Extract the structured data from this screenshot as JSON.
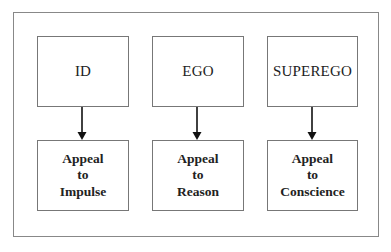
{
  "diagram": {
    "type": "flow",
    "nodes": [
      {
        "id": "id",
        "label": "ID",
        "target": {
          "lines": [
            "Appeal",
            "to",
            "Impulse"
          ]
        }
      },
      {
        "id": "ego",
        "label": "EGO",
        "target": {
          "lines": [
            "Appeal",
            "to",
            "Reason"
          ]
        }
      },
      {
        "id": "superego",
        "label": "SUPEREGO",
        "target": {
          "lines": [
            "Appeal",
            "to",
            "Conscience"
          ]
        }
      }
    ],
    "edges": [
      {
        "from": "ID",
        "to": "Appeal to Impulse"
      },
      {
        "from": "EGO",
        "to": "Appeal to Reason"
      },
      {
        "from": "SUPEREGO",
        "to": "Appeal to Conscience"
      }
    ],
    "colors": {
      "border": "#777777",
      "frame": "#888888",
      "arrow": "#111111",
      "text": "#222222"
    }
  }
}
